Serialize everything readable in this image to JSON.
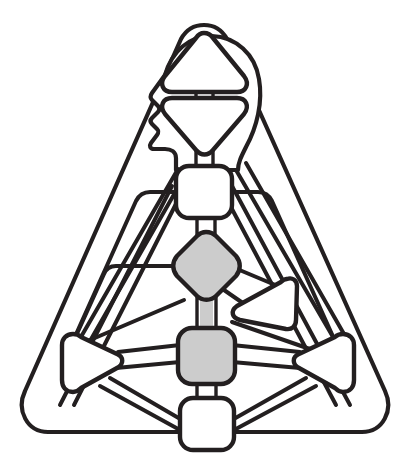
{
  "figure": {
    "title": "Rounded triangular network glyph with head profile",
    "canvas": {
      "width": 410,
      "height": 473
    },
    "background_color": "#ffffff",
    "ink_color": "#231f20",
    "fill_white": "#ffffff",
    "fill_gray": "#cccccc"
  },
  "shapes": {
    "outer_frame": {
      "name": "outer-rounded-triangle",
      "role": "enclosing boundary",
      "fill": "#ffffff",
      "stroke": "#231f20"
    },
    "head_profile": {
      "name": "head-profile-silhouette",
      "role": "human head outline facing left",
      "fill": "#ffffff",
      "stroke": "#231f20"
    },
    "nodes": [
      {
        "id": "node-apex-triangle-up",
        "label": "apex-triangle-up",
        "shape": "triangle-up",
        "fill": "#ffffff",
        "cx": 204,
        "cy": 62
      },
      {
        "id": "node-triangle-down",
        "label": "inverted-triangle",
        "shape": "triangle-down",
        "fill": "#ffffff",
        "cx": 204,
        "cy": 119
      },
      {
        "id": "node-square-upper",
        "label": "upper-square",
        "shape": "rounded-square",
        "fill": "#ffffff",
        "cx": 204,
        "cy": 192
      },
      {
        "id": "node-diamond",
        "label": "center-diamond",
        "shape": "rounded-diamond",
        "fill": "#cccccc",
        "cx": 206,
        "cy": 266
      },
      {
        "id": "node-square-gray",
        "label": "lower-gray-square",
        "shape": "rounded-square",
        "fill": "#cccccc",
        "cx": 206,
        "cy": 354
      },
      {
        "id": "node-square-bottom",
        "label": "bottom-square",
        "shape": "rounded-square",
        "fill": "#ffffff",
        "cx": 206,
        "cy": 424
      },
      {
        "id": "node-triangle-left",
        "label": "left-triangle",
        "shape": "triangle-right",
        "fill": "#ffffff",
        "cx": 94,
        "cy": 362
      },
      {
        "id": "node-triangle-right",
        "label": "right-triangle",
        "shape": "triangle-left",
        "fill": "#ffffff",
        "cx": 322,
        "cy": 362
      },
      {
        "id": "node-triangle-mid-right",
        "label": "mid-right-tilted-triangle",
        "shape": "triangle-tilted",
        "fill": "#ffffff",
        "cx": 262,
        "cy": 303
      }
    ],
    "link_count": 22
  }
}
